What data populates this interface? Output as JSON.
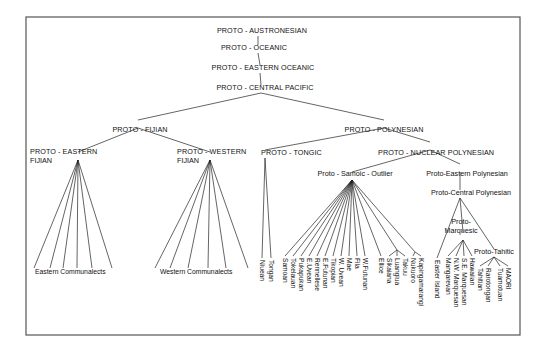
{
  "diagram": {
    "frame": {
      "x": 26,
      "y": 17,
      "w": 494,
      "h": 318
    },
    "nodes": [
      {
        "id": "pan",
        "label": "PROTO - AUSTRONESIAN",
        "x": 262,
        "y": 33,
        "anchor": "middle",
        "hub": [
          258,
          36
        ]
      },
      {
        "id": "poc",
        "label": "PROTO - OCEANIC",
        "x": 254,
        "y": 50,
        "anchor": "middle",
        "hub": [
          258,
          53
        ]
      },
      {
        "id": "peo",
        "label": "PROTO - EASTERN  OCEANIC",
        "x": 263,
        "y": 70,
        "anchor": "middle",
        "hub": [
          260,
          73
        ]
      },
      {
        "id": "pcp",
        "label": "PROTO - CENTRAL   PACIFIC",
        "x": 265,
        "y": 90,
        "anchor": "middle",
        "hub": [
          261,
          93
        ]
      },
      {
        "id": "pfj",
        "label": "PROTO - FIJIAN",
        "x": 140,
        "y": 132,
        "anchor": "middle",
        "hub": [
          138,
          128
        ]
      },
      {
        "id": "ppn",
        "label": "PROTO - POLYNESIAN",
        "x": 384,
        "y": 132,
        "anchor": "middle",
        "hub": [
          384,
          128
        ]
      },
      {
        "id": "pef",
        "label": "PROTO - EASTERN",
        "label2": "FIJIAN",
        "x": 30,
        "y": 154,
        "anchor": "start",
        "hub": [
          78,
          160
        ]
      },
      {
        "id": "pwf",
        "label": "PROTO - WESTERN",
        "label2": "FIJIAN",
        "x": 177,
        "y": 154,
        "anchor": "start",
        "hub": [
          210,
          160
        ]
      },
      {
        "id": "pto",
        "label": "PROTO - TONGIC",
        "x": 261,
        "y": 155,
        "anchor": "start",
        "hub": [
          265,
          158
        ]
      },
      {
        "id": "pnp",
        "label": "PROTO - NUCLEAR   POLYNESIAN",
        "x": 378,
        "y": 155,
        "anchor": "start",
        "hub": [
          430,
          150
        ]
      },
      {
        "id": "pso",
        "label": "Proto - Samoic - Outlier",
        "x": 355,
        "y": 176,
        "anchor": "middle",
        "hub": [
          352,
          180
        ]
      },
      {
        "id": "pep",
        "label": "Proto-Eastern Polynesian",
        "x": 467,
        "y": 176,
        "anchor": "middle",
        "hub": [
          460,
          172
        ]
      },
      {
        "id": "pcpn",
        "label": "Proto-Central Polynesian",
        "x": 471,
        "y": 195,
        "anchor": "middle",
        "hub": [
          460,
          198
        ]
      },
      {
        "id": "pmq",
        "label": "Proto-",
        "label2": "Marquesic",
        "x": 461,
        "y": 224,
        "anchor": "middle",
        "hub": [
          463,
          240
        ]
      },
      {
        "id": "pth",
        "label": "Proto-Tahitic",
        "x": 494,
        "y": 254,
        "anchor": "middle",
        "hub": [
          494,
          257
        ]
      }
    ],
    "edges": [
      [
        "pan",
        "poc"
      ],
      [
        "poc",
        "peo"
      ],
      [
        "peo",
        "pcp"
      ],
      [
        "pcp",
        "pfj"
      ],
      [
        "pcp",
        "ppn"
      ],
      [
        "pfj",
        "pef"
      ],
      [
        "pfj",
        "pwf"
      ],
      [
        "ppn",
        "pto"
      ],
      [
        "ppn",
        "pnp"
      ],
      [
        "pnp",
        "pso"
      ],
      [
        "pnp",
        "pep"
      ],
      [
        "pep",
        "pcpn"
      ],
      [
        "pcpn",
        "pmq"
      ],
      [
        "pcpn",
        "pth"
      ]
    ],
    "fans": [
      {
        "from": "pef",
        "to_y": 268,
        "xs": [
          34,
          50,
          63,
          77,
          92,
          112
        ]
      },
      {
        "from": "pwf",
        "to_y": 268,
        "xs": [
          155,
          170,
          188,
          208,
          226,
          248
        ]
      }
    ],
    "group_labels": [
      {
        "label": "Eastern  Communalects",
        "x": 35,
        "y": 274
      },
      {
        "label": "Western Communalects",
        "x": 160,
        "y": 274
      }
    ],
    "leaves": [
      {
        "label": "Niuean",
        "x": 262,
        "parent": "pto",
        "top": 260
      },
      {
        "label": "Tongan",
        "x": 271,
        "parent": "pto",
        "top": 260
      },
      {
        "label": "Samoan",
        "x": 285,
        "parent": "pso",
        "top": 258
      },
      {
        "label": "Tokelauan",
        "x": 293,
        "parent": "pso",
        "top": 258
      },
      {
        "label": "Pukapukan",
        "x": 301,
        "parent": "pso",
        "top": 258
      },
      {
        "label": "E.Uvean",
        "x": 309,
        "parent": "pso",
        "top": 258
      },
      {
        "label": "Rennellese",
        "x": 317,
        "parent": "pso",
        "top": 258
      },
      {
        "label": "E.Futunan",
        "x": 325,
        "parent": "pso",
        "top": 258
      },
      {
        "label": "Tikopian",
        "x": 333,
        "parent": "pso",
        "top": 258
      },
      {
        "label": "W. Uvean",
        "x": 341,
        "parent": "pso",
        "top": 258
      },
      {
        "label": "Mae",
        "x": 349,
        "parent": "pso",
        "top": 258
      },
      {
        "label": "Fila",
        "x": 357,
        "parent": "pso",
        "top": 258
      },
      {
        "label": "W.Futunan",
        "x": 365,
        "parent": "pso",
        "top": 258
      },
      {
        "label": "Ellice",
        "x": 381,
        "parent": "pso",
        "top": 258
      },
      {
        "label": "Sikaiana",
        "x": 389,
        "parent": "sub1",
        "top": 258
      },
      {
        "label": "Luangiua",
        "x": 397,
        "parent": "sub1",
        "top": 258
      },
      {
        "label": "Takuu",
        "x": 405,
        "parent": "sub1",
        "top": 258
      },
      {
        "label": "Nukuoro",
        "x": 413,
        "parent": "sub2",
        "top": 258
      },
      {
        "label": "Kapingamarangi",
        "x": 421,
        "parent": "sub2",
        "top": 258
      },
      {
        "label": "Easter Island",
        "x": 437,
        "parent": "pcpn",
        "top": 260
      },
      {
        "label": "Mangarevan",
        "x": 448,
        "parent": "pmq",
        "top": 258
      },
      {
        "label": "N.W. Marquesan",
        "x": 456,
        "parent": "pmq",
        "top": 258
      },
      {
        "label": "S.E. Marquesan",
        "x": 464,
        "parent": "pmq",
        "top": 258
      },
      {
        "label": "Hawaiian",
        "x": 472,
        "parent": "pmq",
        "top": 258
      },
      {
        "label": "Tahitian",
        "x": 480,
        "parent": "pth",
        "top": 268
      },
      {
        "label": "Rarotongan",
        "x": 488,
        "parent": "pth",
        "top": 268
      },
      {
        "label": "Tuamotuan",
        "x": 500,
        "parent": "pth",
        "top": 268
      },
      {
        "label": "MAORI",
        "x": 508,
        "parent": "pth",
        "top": 268
      }
    ],
    "sub_hubs": [
      {
        "id": "sub1",
        "x": 397,
        "y": 250,
        "parent": "pso"
      },
      {
        "id": "sub2",
        "x": 415,
        "y": 252,
        "parent": "pso"
      }
    ],
    "colors": {
      "line": "#222222",
      "text": "#111111",
      "frame": "#555555",
      "background": "#ffffff"
    }
  }
}
